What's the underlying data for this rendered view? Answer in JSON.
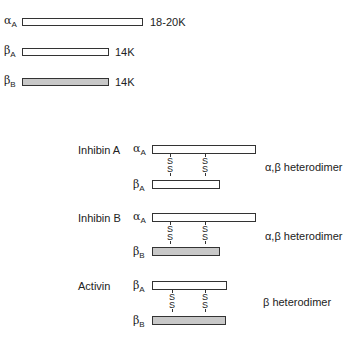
{
  "subunits": [
    {
      "symbol": "α",
      "sub": "A",
      "size": "18-20K",
      "shade": "white"
    },
    {
      "symbol": "β",
      "sub": "A",
      "size": "14K",
      "shade": "white"
    },
    {
      "symbol": "β",
      "sub": "B",
      "size": "14K",
      "shade": "gray"
    }
  ],
  "dimers": [
    {
      "name": "Inhibin A",
      "top": {
        "symbol": "α",
        "sub": "A"
      },
      "bottom": {
        "symbol": "β",
        "sub": "A"
      },
      "type": "α,β heterodimer"
    },
    {
      "name": "Inhibin B",
      "top": {
        "symbol": "α",
        "sub": "A"
      },
      "bottom": {
        "symbol": "β",
        "sub": "B"
      },
      "type": "α,β heterodimer"
    },
    {
      "name": "Activin",
      "top": {
        "symbol": "β",
        "sub": "A"
      },
      "bottom": {
        "symbol": "β",
        "sub": "B"
      },
      "type": "β heterodimer"
    }
  ],
  "disulfide": "S",
  "colors": {
    "stroke": "#333333",
    "gray_fill": "#c8c8c8"
  }
}
